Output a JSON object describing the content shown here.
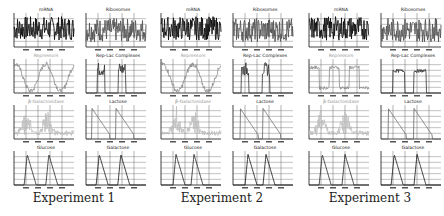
{
  "captions": [
    "Experiment 1",
    "Experiment 2",
    "Experiment 3"
  ],
  "colors": {
    "mRNA": "#111111",
    "Ribosomes": "#555555",
    "Repressors": "#8a8a8a",
    "Rep-Lac Complexes": "#333333",
    "b-Galactosidase": "#bdbdbd",
    "Lactose": "#666666",
    "Glucose": "#222222",
    "Galactose": "#111111",
    "grid": "#666666",
    "axis": "#111111"
  },
  "panel_titles": [
    "mRNA",
    "Ribosomes",
    "Repressors",
    "Rep-Lac Complexes",
    "β-Galactosidase",
    "Lactose",
    "Glucose",
    "Galactose"
  ],
  "chart_data": [
    {
      "type": "line",
      "experiment": "Experiment 1",
      "subplots": [
        {
          "title": "mRNA",
          "style": "noisy",
          "level": 0.55,
          "amp": 0.35
        },
        {
          "title": "Ribosomes",
          "style": "noisy",
          "level": 0.5,
          "amp": 0.35
        },
        {
          "title": "Repressors",
          "style": "wave",
          "periods": 2
        },
        {
          "title": "Rep-Lac Complexes",
          "style": "bursts",
          "centers": [
            0.25,
            0.6
          ]
        },
        {
          "title": "β-Galactosidase",
          "style": "spikes",
          "centers": [
            0.2,
            0.55
          ]
        },
        {
          "title": "Lactose",
          "style": "decay",
          "starts": [
            0.1,
            0.5
          ]
        },
        {
          "title": "Glucose",
          "style": "peaks",
          "centers": [
            0.22,
            0.58
          ]
        },
        {
          "title": "Galactose",
          "style": "peaks",
          "centers": [
            0.22,
            0.58
          ]
        }
      ]
    },
    {
      "type": "line",
      "experiment": "Experiment 2",
      "subplots": [
        {
          "title": "mRNA",
          "style": "noisy",
          "level": 0.55,
          "amp": 0.35
        },
        {
          "title": "Ribosomes",
          "style": "noisy",
          "level": 0.5,
          "amp": 0.35
        },
        {
          "title": "Repressors",
          "style": "wave",
          "periods": 2
        },
        {
          "title": "Rep-Lac Complexes",
          "style": "bursts",
          "centers": [
            0.2,
            0.55
          ]
        },
        {
          "title": "β-Galactosidase",
          "style": "spikes",
          "centers": [
            0.25,
            0.55
          ]
        },
        {
          "title": "Lactose",
          "style": "decay",
          "starts": [
            0.12,
            0.5
          ]
        },
        {
          "title": "Glucose",
          "style": "peaks",
          "centers": [
            0.25,
            0.55
          ]
        },
        {
          "title": "Galactose",
          "style": "peaks",
          "centers": [
            0.25,
            0.55
          ]
        }
      ]
    },
    {
      "type": "line",
      "experiment": "Experiment 3",
      "subplots": [
        {
          "title": "mRNA",
          "style": "noisy",
          "level": 0.55,
          "amp": 0.35
        },
        {
          "title": "Ribosomes",
          "style": "noisy",
          "level": 0.5,
          "amp": 0.35
        },
        {
          "title": "Repressors",
          "style": "square",
          "periods": 3
        },
        {
          "title": "Rep-Lac Complexes",
          "style": "plateaus",
          "centers": [
            0.3,
            0.65
          ]
        },
        {
          "title": "β-Galactosidase",
          "style": "spikes",
          "centers": [
            0.2,
            0.6
          ]
        },
        {
          "title": "Lactose",
          "style": "decay",
          "starts": [
            0.12,
            0.55
          ]
        },
        {
          "title": "Glucose",
          "style": "peaks",
          "centers": [
            0.22,
            0.6
          ]
        },
        {
          "title": "Galactose",
          "style": "peaks",
          "centers": [
            0.22,
            0.6
          ]
        }
      ]
    }
  ]
}
